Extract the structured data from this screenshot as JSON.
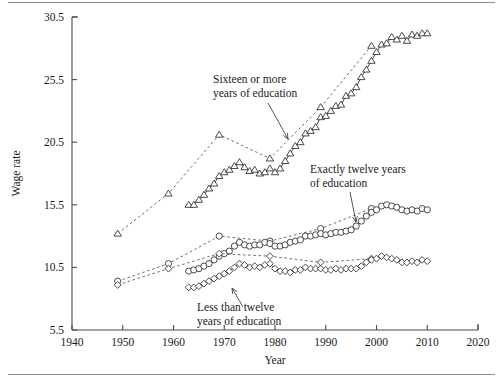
{
  "figure": {
    "background": "#ffffff",
    "frame_color": "#8a8a8a"
  },
  "chart_data": {
    "type": "line",
    "title": "",
    "xlabel": "Year",
    "ylabel": "Wage rate",
    "xlim": [
      1940,
      2020
    ],
    "ylim": [
      5.5,
      30.5
    ],
    "xticks": [
      1940,
      1950,
      1960,
      1970,
      1980,
      1990,
      2000,
      2010,
      2020
    ],
    "yticks": [
      5.5,
      10.5,
      15.5,
      20.5,
      25.5,
      30.5
    ],
    "grid": false,
    "legend_position": "annotations-inline",
    "annotations": [
      {
        "id": "annot-sixteen",
        "text_line1": "Sixteen or more",
        "text_line2": "years of education",
        "x_px": 213,
        "y_px": 83,
        "arrow_from": [
          268,
          103
        ],
        "arrow_to": [
          288,
          139
        ]
      },
      {
        "id": "annot-twelve",
        "text_line1": "Exactly twelve years",
        "text_line2": "of education",
        "x_px": 310,
        "y_px": 173,
        "arrow_from": [
          350,
          192
        ],
        "arrow_to": [
          356,
          222
        ]
      },
      {
        "id": "annot-less-twelve",
        "text_line1": "Less than twelve",
        "text_line2": "years of education",
        "x_px": 197,
        "y_px": 311,
        "arrow_from": [
          243,
          307
        ],
        "arrow_to": [
          232,
          288
        ]
      }
    ],
    "series": [
      {
        "name": "Sixteen or more years of education (census)",
        "marker": "triangle",
        "linestyle": "dashed",
        "x": [
          1949,
          1959,
          1969,
          1979,
          1989,
          1999
        ],
        "values": [
          13.2,
          16.4,
          21.1,
          19.2,
          23.3,
          28.2
        ]
      },
      {
        "name": "Sixteen or more years of education (annual)",
        "marker": "triangle",
        "linestyle": "solid",
        "x": [
          1963,
          1964,
          1965,
          1966,
          1967,
          1968,
          1969,
          1970,
          1971,
          1972,
          1973,
          1974,
          1975,
          1976,
          1977,
          1978,
          1979,
          1980,
          1981,
          1982,
          1983,
          1984,
          1985,
          1986,
          1987,
          1988,
          1989,
          1990,
          1991,
          1992,
          1993,
          1994,
          1995,
          1996,
          1997,
          1998,
          1999,
          2000,
          2001,
          2002,
          2003,
          2004,
          2005,
          2006,
          2007,
          2008,
          2009,
          2010
        ],
        "values": [
          15.5,
          15.5,
          15.9,
          16.3,
          16.8,
          17.2,
          17.8,
          18.1,
          18.3,
          18.6,
          18.9,
          18.5,
          18.2,
          18.3,
          18.0,
          18.1,
          18.4,
          18.1,
          18.4,
          19.0,
          19.6,
          20.2,
          20.5,
          21.2,
          21.4,
          21.7,
          22.5,
          22.6,
          23.0,
          23.4,
          23.5,
          24.2,
          24.4,
          24.9,
          25.7,
          26.3,
          27.0,
          27.7,
          28.3,
          28.4,
          28.9,
          28.7,
          29.0,
          28.6,
          29.1,
          29.0,
          29.2,
          29.2
        ]
      },
      {
        "name": "Exactly twelve years of education (census)",
        "marker": "circle",
        "linestyle": "dashed",
        "x": [
          1949,
          1959,
          1969,
          1979,
          1989,
          1999
        ],
        "values": [
          9.4,
          10.8,
          13.0,
          12.6,
          13.6,
          15.2
        ]
      },
      {
        "name": "Exactly twelve years of education (annual)",
        "marker": "circle",
        "linestyle": "solid",
        "x": [
          1963,
          1964,
          1965,
          1966,
          1967,
          1968,
          1969,
          1970,
          1971,
          1972,
          1973,
          1974,
          1975,
          1976,
          1977,
          1978,
          1979,
          1980,
          1981,
          1982,
          1983,
          1984,
          1985,
          1986,
          1987,
          1988,
          1989,
          1990,
          1991,
          1992,
          1993,
          1994,
          1995,
          1996,
          1997,
          1998,
          1999,
          2000,
          2001,
          2002,
          2003,
          2004,
          2005,
          2006,
          2007,
          2008,
          2009,
          2010
        ],
        "values": [
          10.2,
          10.3,
          10.4,
          10.6,
          10.8,
          11.1,
          11.4,
          11.6,
          11.8,
          12.2,
          12.5,
          12.3,
          12.2,
          12.3,
          12.3,
          12.5,
          12.4,
          12.2,
          12.2,
          12.3,
          12.5,
          12.6,
          12.7,
          13.0,
          13.0,
          13.1,
          13.2,
          13.1,
          13.2,
          13.3,
          13.3,
          13.4,
          13.5,
          13.8,
          14.2,
          14.6,
          14.9,
          15.1,
          15.4,
          15.5,
          15.4,
          15.3,
          15.1,
          15.0,
          15.1,
          15.0,
          15.2,
          15.1
        ]
      },
      {
        "name": "Less than twelve years of education (census)",
        "marker": "diamond",
        "linestyle": "dashed",
        "x": [
          1949,
          1959,
          1969,
          1979,
          1989,
          1999
        ],
        "values": [
          9.1,
          10.4,
          11.6,
          11.4,
          10.9,
          11.2
        ]
      },
      {
        "name": "Less than twelve years of education (annual)",
        "marker": "diamond",
        "linestyle": "solid",
        "x": [
          1963,
          1964,
          1965,
          1966,
          1967,
          1968,
          1969,
          1970,
          1971,
          1972,
          1973,
          1974,
          1975,
          1976,
          1977,
          1978,
          1979,
          1980,
          1981,
          1982,
          1983,
          1984,
          1985,
          1986,
          1987,
          1988,
          1989,
          1990,
          1991,
          1992,
          1993,
          1994,
          1995,
          1996,
          1997,
          1998,
          1999,
          2000,
          2001,
          2002,
          2003,
          2004,
          2005,
          2006,
          2007,
          2008,
          2009,
          2010
        ],
        "values": [
          8.9,
          8.9,
          9.0,
          9.2,
          9.4,
          9.6,
          9.8,
          10.0,
          10.2,
          10.5,
          10.8,
          10.7,
          10.5,
          10.6,
          10.5,
          10.7,
          10.8,
          10.4,
          10.2,
          10.2,
          10.1,
          10.3,
          10.3,
          10.5,
          10.4,
          10.4,
          10.4,
          10.3,
          10.3,
          10.4,
          10.3,
          10.4,
          10.4,
          10.4,
          10.6,
          10.9,
          11.1,
          11.2,
          11.4,
          11.3,
          11.2,
          11.1,
          10.9,
          10.9,
          11.0,
          10.9,
          11.1,
          11.0
        ]
      }
    ]
  }
}
